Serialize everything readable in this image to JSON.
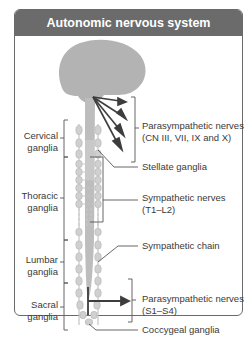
{
  "figure": {
    "title": "Autonomic nervous system",
    "labels_left": {
      "cervical": [
        "Cervical",
        "ganglia"
      ],
      "thoracic": [
        "Thoracic",
        "ganglia"
      ],
      "lumbar": [
        "Lumbar",
        "ganglia"
      ],
      "sacral": [
        "Sacral",
        "ganglia"
      ]
    },
    "labels_right": {
      "parasympathetic_cranial": [
        "Parasympathetic nerves",
        "(CN III, VII, IX and X)"
      ],
      "stellate": "Stellate ganglia",
      "sympathetic_nerves": [
        "Sympathetic nerves",
        "(T1–L2)"
      ],
      "sympathetic_chain": "Sympathetic chain",
      "parasympathetic_sacral": [
        "Parasympathetic nerves",
        "(S1–S4)"
      ],
      "coccygeal": "Coccygeal ganglia"
    },
    "colors": {
      "header": "#6b6b6b",
      "brain": "#b3b3b3",
      "ganglia": "#d0d0d0",
      "arrow": "#3d3d3d",
      "line": "#555555"
    }
  }
}
